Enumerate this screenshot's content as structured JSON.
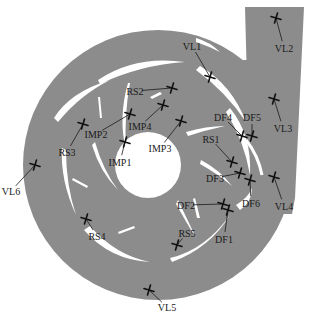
{
  "figure": {
    "colors": {
      "fluid": "#8c8c8c",
      "solid": "#ffffff",
      "marker": "#111111"
    }
  },
  "monitoring_points": [
    {
      "id": "VL1",
      "label": "VL1",
      "group": "volute",
      "marker": [
        210,
        77
      ],
      "text": [
        192,
        46
      ]
    },
    {
      "id": "VL2",
      "label": "VL2",
      "group": "volute",
      "marker": [
        276,
        18
      ],
      "text": [
        284,
        48
      ]
    },
    {
      "id": "VL3",
      "label": "VL3",
      "group": "volute",
      "marker": [
        274,
        99
      ],
      "text": [
        283,
        128
      ]
    },
    {
      "id": "VL4",
      "label": "VL4",
      "group": "volute",
      "marker": [
        274,
        177
      ],
      "text": [
        284,
        206
      ]
    },
    {
      "id": "VL5",
      "label": "VL5",
      "group": "volute",
      "marker": [
        149,
        290
      ],
      "text": [
        167,
        307
      ]
    },
    {
      "id": "VL6",
      "label": "VL6",
      "group": "volute",
      "marker": [
        35,
        165
      ],
      "text": [
        11,
        191
      ]
    },
    {
      "id": "RS1",
      "label": "RS1",
      "group": "rotor-stator",
      "marker": [
        232,
        162
      ],
      "text": [
        211,
        139
      ]
    },
    {
      "id": "RS2",
      "label": "RS2",
      "group": "rotor-stator",
      "marker": [
        172,
        88
      ],
      "text": [
        135,
        91
      ]
    },
    {
      "id": "RS3",
      "label": "RS3",
      "group": "rotor-stator",
      "marker": [
        83,
        124
      ],
      "text": [
        67,
        152
      ]
    },
    {
      "id": "RS4",
      "label": "RS4",
      "group": "rotor-stator",
      "marker": [
        86,
        219
      ],
      "text": [
        97,
        236
      ]
    },
    {
      "id": "RS5",
      "label": "RS5",
      "group": "rotor-stator",
      "marker": [
        177,
        245
      ],
      "text": [
        187,
        233
      ]
    },
    {
      "id": "IMP1",
      "label": "IMP1",
      "group": "impeller",
      "marker": [
        125,
        142
      ],
      "text": [
        120,
        162
      ]
    },
    {
      "id": "IMP2",
      "label": "IMP2",
      "group": "impeller",
      "marker": [
        130,
        114
      ],
      "text": [
        96,
        134
      ]
    },
    {
      "id": "IMP3",
      "label": "IMP3",
      "group": "impeller",
      "marker": [
        181,
        121
      ],
      "text": [
        160,
        148
      ]
    },
    {
      "id": "IMP4",
      "label": "IMP4",
      "group": "impeller",
      "marker": [
        163,
        105
      ],
      "text": [
        140,
        126
      ]
    },
    {
      "id": "DF1",
      "label": "DF1",
      "group": "diffuser",
      "marker": [
        228,
        210
      ],
      "text": [
        224,
        239
      ]
    },
    {
      "id": "DF2",
      "label": "DF2",
      "group": "diffuser",
      "marker": [
        223,
        204
      ],
      "text": [
        186,
        205
      ]
    },
    {
      "id": "DF3",
      "label": "DF3",
      "group": "diffuser",
      "marker": [
        240,
        173
      ],
      "text": [
        215,
        178
      ]
    },
    {
      "id": "DF4",
      "label": "DF4",
      "group": "diffuser",
      "marker": [
        242,
        136
      ],
      "text": [
        223,
        117
      ]
    },
    {
      "id": "DF5",
      "label": "DF5",
      "group": "diffuser",
      "marker": [
        252,
        136
      ],
      "text": [
        252,
        117
      ]
    },
    {
      "id": "DF6",
      "label": "DF6",
      "group": "diffuser",
      "marker": [
        250,
        180
      ],
      "text": [
        251,
        203
      ]
    }
  ]
}
